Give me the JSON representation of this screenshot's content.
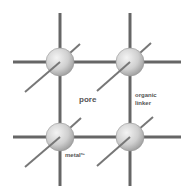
{
  "diagram": {
    "labels": {
      "pore": "pore",
      "organic_linker_line1": "organic",
      "organic_linker_line2": "linker",
      "metal": "metal",
      "metal_superscript": "n+"
    },
    "nodes": [
      {
        "id": "node-top-left",
        "type": "metal"
      },
      {
        "id": "node-top-right",
        "type": "metal"
      },
      {
        "id": "node-bottom-left",
        "type": "metal"
      },
      {
        "id": "node-bottom-right",
        "type": "metal"
      }
    ],
    "colors": {
      "linker": "#666666",
      "node_fill_light": "#f2f2f2",
      "node_fill_dark": "#a8a8a8",
      "text": "#555555"
    }
  }
}
